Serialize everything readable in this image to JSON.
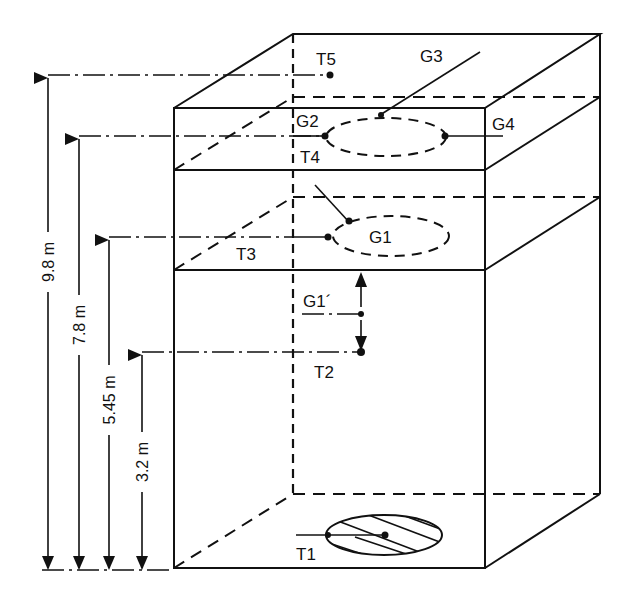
{
  "diagram": {
    "labels": {
      "t1": "T1",
      "t2": "T2",
      "t3": "T3",
      "t4": "T4",
      "t5": "T5",
      "g1": "G1",
      "g1_prime": "G1´",
      "g2": "G2",
      "g3": "G3",
      "g4": "G4"
    },
    "dimensions": [
      {
        "label": "9.8 m",
        "target": "T5"
      },
      {
        "label": "7.8 m",
        "target": "T4/G2"
      },
      {
        "label": "5.45 m",
        "target": "T3/G1"
      },
      {
        "label": "3.2 m",
        "target": "T2"
      }
    ],
    "colors": {
      "ink": "#111111",
      "background": "#ffffff"
    }
  }
}
